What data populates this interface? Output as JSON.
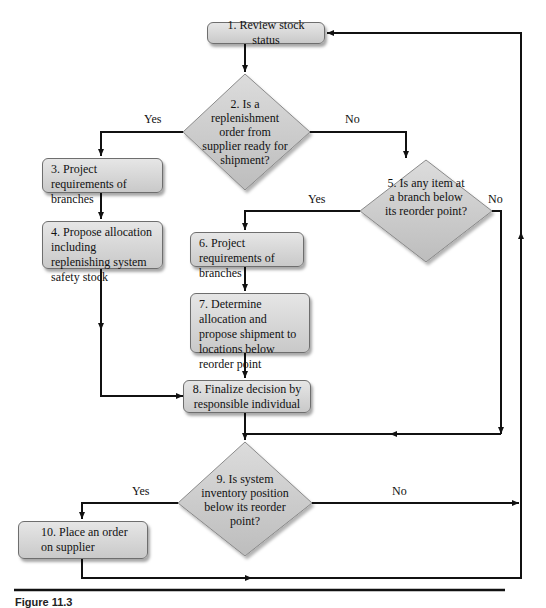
{
  "flowchart": {
    "nodes": {
      "n1": "1. Review stock status",
      "n2": "2. Is a replenishment order from supplier ready for shipment?",
      "n3": "3. Project requirements of branches",
      "n4": "4. Propose allocation including replenishing system safety stock",
      "n5": "5. Is any item at a branch below its reorder point?",
      "n6": "6. Project requirements of branches",
      "n7": "7. Determine allocation and propose shipment to locations below reorder point",
      "n8": "8. Finalize decision by responsible individual",
      "n9": "9. Is system inventory position below its reorder point?",
      "n10": "10. Place an order on supplier"
    },
    "labels": {
      "d2_yes": "Yes",
      "d2_no": "No",
      "d5_yes": "Yes",
      "d5_no": "No",
      "d9_yes": "Yes",
      "d9_no": "No"
    },
    "colors": {
      "box_fill_top": "#e6e6e6",
      "box_fill_bottom": "#c9c9c9",
      "diamond_fill": "#c8c8c8",
      "line": "#111111"
    }
  },
  "caption": "Figure 11.3"
}
